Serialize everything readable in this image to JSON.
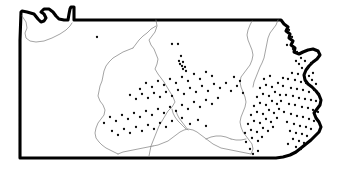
{
  "figure": {
    "kind": "distribution-map",
    "region_name": "Pennsylvania",
    "title": "",
    "caption": "",
    "background_color": "#ffffff",
    "outline_color": "#000000",
    "outline_width_px": 3.1,
    "internal_boundary_color": "#7d7d7d",
    "internal_boundary_width_px": 0.7,
    "dot_color": "#0a0a0a",
    "dot_radius_px": 1.15,
    "dot_count": 181,
    "width_px": 339,
    "height_px": 175
  },
  "chart_data": {
    "type": "scatter",
    "title": "",
    "xlabel": "",
    "ylabel": "",
    "xlim": [
      0,
      339
    ],
    "ylim": [
      0,
      175
    ],
    "grid": false,
    "legend": null,
    "series": [
      {
        "name": "occurrence-records",
        "marker": "dot",
        "color": "#0a0a0a",
        "points": [
          [
            97,
            37
          ],
          [
            172,
            44
          ],
          [
            178,
            44
          ],
          [
            181,
            56
          ],
          [
            179,
            61
          ],
          [
            183,
            62
          ],
          [
            180,
            64
          ],
          [
            182,
            66
          ],
          [
            185,
            67
          ],
          [
            183,
            69
          ],
          [
            186,
            71
          ],
          [
            289,
            30
          ],
          [
            292,
            37
          ],
          [
            287,
            45
          ],
          [
            293,
            49
          ],
          [
            297,
            52
          ],
          [
            301,
            58
          ],
          [
            296,
            61
          ],
          [
            299,
            64
          ],
          [
            305,
            61
          ],
          [
            302,
            68
          ],
          [
            308,
            68
          ],
          [
            311,
            63
          ],
          [
            292,
            73
          ],
          [
            298,
            74
          ],
          [
            304,
            74
          ],
          [
            309,
            76
          ],
          [
            313,
            73
          ],
          [
            288,
            79
          ],
          [
            295,
            80
          ],
          [
            301,
            82
          ],
          [
            306,
            83
          ],
          [
            312,
            80
          ],
          [
            316,
            84
          ],
          [
            283,
            86
          ],
          [
            291,
            88
          ],
          [
            297,
            89
          ],
          [
            303,
            90
          ],
          [
            309,
            92
          ],
          [
            314,
            90
          ],
          [
            319,
            94
          ],
          [
            286,
            95
          ],
          [
            293,
            96
          ],
          [
            299,
            98
          ],
          [
            305,
            99
          ],
          [
            311,
            100
          ],
          [
            316,
            101
          ],
          [
            281,
            101
          ],
          [
            289,
            104
          ],
          [
            295,
            105
          ],
          [
            302,
            107
          ],
          [
            308,
            108
          ],
          [
            313,
            110
          ],
          [
            318,
            112
          ],
          [
            284,
            112
          ],
          [
            291,
            114
          ],
          [
            297,
            116
          ],
          [
            303,
            117
          ],
          [
            309,
            119
          ],
          [
            314,
            121
          ],
          [
            287,
            122
          ],
          [
            294,
            124
          ],
          [
            300,
            126
          ],
          [
            306,
            127
          ],
          [
            311,
            129
          ],
          [
            290,
            131
          ],
          [
            296,
            133
          ],
          [
            302,
            134
          ],
          [
            307,
            136
          ],
          [
            293,
            139
          ],
          [
            299,
            141
          ],
          [
            304,
            143
          ],
          [
            288,
            144
          ],
          [
            296,
            147
          ],
          [
            301,
            149
          ],
          [
            250,
            149
          ],
          [
            253,
            154
          ],
          [
            258,
            151
          ],
          [
            246,
            142
          ],
          [
            252,
            138
          ],
          [
            258,
            141
          ],
          [
            262,
            137
          ],
          [
            245,
            133
          ],
          [
            251,
            130
          ],
          [
            257,
            132
          ],
          [
            263,
            128
          ],
          [
            268,
            131
          ],
          [
            273,
            127
          ],
          [
            248,
            124
          ],
          [
            254,
            121
          ],
          [
            260,
            123
          ],
          [
            266,
            119
          ],
          [
            271,
            122
          ],
          [
            277,
            118
          ],
          [
            251,
            115
          ],
          [
            257,
            112
          ],
          [
            263,
            114
          ],
          [
            269,
            110
          ],
          [
            274,
            113
          ],
          [
            279,
            109
          ],
          [
            254,
            106
          ],
          [
            260,
            103
          ],
          [
            266,
            105
          ],
          [
            272,
            101
          ],
          [
            277,
            104
          ],
          [
            257,
            97
          ],
          [
            263,
            94
          ],
          [
            269,
            96
          ],
          [
            275,
            92
          ],
          [
            280,
            95
          ],
          [
            260,
            88
          ],
          [
            266,
            85
          ],
          [
            272,
            87
          ],
          [
            278,
            83
          ],
          [
            283,
            78
          ],
          [
            264,
            79
          ],
          [
            270,
            76
          ],
          [
            240,
            81
          ],
          [
            234,
            77
          ],
          [
            237,
            86
          ],
          [
            231,
            91
          ],
          [
            243,
            93
          ],
          [
            226,
            83
          ],
          [
            220,
            88
          ],
          [
            214,
            84
          ],
          [
            208,
            91
          ],
          [
            202,
            86
          ],
          [
            196,
            92
          ],
          [
            190,
            88
          ],
          [
            184,
            94
          ],
          [
            178,
            90
          ],
          [
            172,
            96
          ],
          [
            166,
            92
          ],
          [
            160,
            97
          ],
          [
            154,
            93
          ],
          [
            148,
            98
          ],
          [
            142,
            94
          ],
          [
            136,
            99
          ],
          [
            130,
            95
          ],
          [
            212,
            76
          ],
          [
            206,
            72
          ],
          [
            200,
            79
          ],
          [
            194,
            74
          ],
          [
            188,
            81
          ],
          [
            182,
            77
          ],
          [
            176,
            83
          ],
          [
            170,
            79
          ],
          [
            164,
            85
          ],
          [
            158,
            81
          ],
          [
            152,
            87
          ],
          [
            146,
            83
          ],
          [
            140,
            89
          ],
          [
            218,
            98
          ],
          [
            212,
            104
          ],
          [
            206,
            100
          ],
          [
            200,
            107
          ],
          [
            194,
            102
          ],
          [
            188,
            109
          ],
          [
            182,
            105
          ],
          [
            176,
            111
          ],
          [
            170,
            107
          ],
          [
            164,
            113
          ],
          [
            158,
            109
          ],
          [
            152,
            115
          ],
          [
            146,
            111
          ],
          [
            140,
            117
          ],
          [
            134,
            113
          ],
          [
            128,
            119
          ],
          [
            122,
            115
          ],
          [
            116,
            121
          ],
          [
            110,
            117
          ],
          [
            104,
            123
          ],
          [
            172,
            121
          ],
          [
            166,
            127
          ],
          [
            160,
            123
          ],
          [
            154,
            129
          ],
          [
            148,
            125
          ],
          [
            142,
            131
          ],
          [
            136,
            127
          ],
          [
            130,
            133
          ],
          [
            124,
            129
          ],
          [
            118,
            135
          ],
          [
            112,
            131
          ],
          [
            182,
            118
          ],
          [
            190,
            124
          ],
          [
            198,
            120
          ],
          [
            206,
            126
          ]
        ]
      }
    ]
  },
  "geometry": {
    "state_outline_path": "M 21 12 L 22 11 L 27 12 L 34 14 L 38 19 L 41 22 L 44 21 L 46 18 L 44 14 L 41 12 L 44 9 L 49 9 L 53 12 L 56 16 L 59 19 L 64 20 L 68 20 L 69 14 L 70 9 L 71 7 L 74 7 L 74 20 L 88 20 L 120 20 L 160 20 L 200 20 L 240 20 L 270 20 L 281 20 L 284 24 L 288 27 L 286 31 L 290 34 L 289 38 L 293 41 L 291 45 L 295 48 L 294 52 L 299 54 L 303 52 L 308 50 L 313 49 L 318 51 L 320 55 L 317 59 L 313 62 L 309 66 L 306 70 L 304 75 L 305 80 L 308 84 L 312 87 L 316 91 L 319 95 L 321 100 L 320 105 L 317 109 L 314 113 L 316 118 L 319 122 L 321 127 L 319 132 L 315 136 L 311 140 L 306 144 L 301 148 L 296 152 L 290 155 L 283 157 L 276 158 L 268 158 L 260 158 L 250 158 L 230 158 L 200 158 L 160 158 L 120 158 L 80 158 L 40 158 L 20 158 L 20 120 L 20 80 L 20 40 Z",
    "erie_inner_path": "M 22 14 L 28 15 L 35 17 L 40 21 L 43 23 L 47 22 L 50 19 L 48 15 L 45 12 L 47 11 L 51 12 L 55 16 L 58 20 L 63 22 L 69 22",
    "erie_shore_path": "M 22 16 L 26 22 L 27 28 L 25 33 L 26 38 L 30 41 L 36 42 L 44 41 L 52 38 L 60 34 L 66 30 L 70 26 L 72 23",
    "internal_boundaries": [
      "M 156 20 L 157 26 L 155 32 L 152 36 L 149 40 L 151 45 L 154 49 L 156 54 L 158 59 L 157 64 L 155 69 L 158 74 L 161 78 L 164 82 L 167 87 L 170 92 L 173 97 L 175 102 L 172 107 L 168 111 L 165 116 L 162 121 L 159 126 L 157 131 L 155 136 L 153 141 L 151 146 L 150 151 L 149 156",
      "M 156 26 L 151 29 L 147 33 L 143 36 L 139 40 L 136 44 L 133 48",
      "M 133 48 L 128 50 L 123 52 L 118 55 L 113 58 L 109 62 L 106 66 L 104 71 L 103 76 L 102 81 L 100 86 L 99 91 L 98 96 L 100 101 L 103 105 L 105 110 L 104 115 L 101 119 L 98 123 L 96 128 L 95 133 L 96 138 L 99 142 L 102 145 L 106 148 L 110 150 L 114 152 L 118 154",
      "M 118 154 L 123 152 L 128 151 L 133 150 L 138 149 L 143 148 L 148 147 L 153 146",
      "M 153 146 L 158 145 L 163 143 L 168 141 L 172 138 L 176 135 L 180 132 L 184 130 L 188 129 L 193 130 L 197 132 L 201 135 L 205 138 L 209 141 L 213 144 L 217 146 L 221 148 L 226 149 L 231 150 L 236 151 L 241 152 L 246 153 L 251 154",
      "M 251 154 L 253 149 L 252 144 L 249 140 L 246 136 L 243 132 L 241 127 L 240 122 L 241 117 L 243 112 L 245 107 L 246 102 L 245 97 L 243 92 L 241 87 L 240 82 L 241 77 L 244 73 L 247 69 L 250 65 L 252 60 L 253 55 L 252 50 L 250 45 L 248 40 L 247 35 L 248 30 L 250 25 L 252 21",
      "M 186 129 L 182 125 L 178 121 L 175 117 L 173 113 L 172 109",
      "M 188 130 L 185 126 L 182 122 L 179 118 L 177 114 L 176 110",
      "M 206 139 L 211 137 L 216 136 L 221 136 L 226 137 L 231 139",
      "M 231 139 L 236 140 L 241 140 L 246 139",
      "M 278 20 L 276 25 L 273 29 L 270 33 L 268 38 L 267 43 L 266 48 L 265 53 L 264 58 L 262 63 L 260 67 L 258 72 L 256 77 L 254 82 L 253 87"
    ]
  }
}
